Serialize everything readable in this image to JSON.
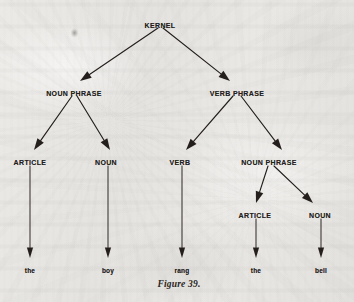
{
  "figure": {
    "caption": "Figure 39.",
    "caption_x": 179,
    "caption_y": 279
  },
  "colors": {
    "paper": "#e8e8e6",
    "ink": "#241f1d",
    "caption_ink": "#2a2522"
  },
  "artifacts": [
    {
      "name": "scan-smudge",
      "x": 69,
      "y": 27,
      "w": 11,
      "h": 13
    }
  ],
  "chart_data": {
    "type": "diagram",
    "subtype": "syntactic-parse-tree",
    "title": "Figure 39.",
    "sentence": "the boy rang the bell",
    "nodes": [
      {
        "id": "kernel",
        "label": "KERNEL",
        "level": 0,
        "kind": "nonterminal",
        "x": 160,
        "y": 22
      },
      {
        "id": "np1",
        "label": "NOUN PHRASE",
        "level": 1,
        "kind": "nonterminal",
        "x": 74,
        "y": 90
      },
      {
        "id": "vp",
        "label": "VERB PHRASE",
        "level": 1,
        "kind": "nonterminal",
        "x": 237,
        "y": 90
      },
      {
        "id": "art1",
        "label": "ARTICLE",
        "level": 2,
        "kind": "nonterminal",
        "x": 30,
        "y": 159
      },
      {
        "id": "noun1",
        "label": "NOUN",
        "level": 2,
        "kind": "nonterminal",
        "x": 106,
        "y": 159
      },
      {
        "id": "verb",
        "label": "VERB",
        "level": 2,
        "kind": "nonterminal",
        "x": 180,
        "y": 159
      },
      {
        "id": "np2",
        "label": "NOUN PHRASE",
        "level": 2,
        "kind": "nonterminal",
        "x": 269,
        "y": 159
      },
      {
        "id": "art2",
        "label": "ARTICLE",
        "level": 3,
        "kind": "nonterminal",
        "x": 255,
        "y": 212
      },
      {
        "id": "noun2",
        "label": "NOUN",
        "level": 3,
        "kind": "nonterminal",
        "x": 320,
        "y": 212
      },
      {
        "id": "word_the1",
        "label": "the",
        "level": 4,
        "kind": "terminal",
        "x": 30,
        "y": 267
      },
      {
        "id": "word_boy",
        "label": "boy",
        "level": 4,
        "kind": "terminal",
        "x": 108,
        "y": 267
      },
      {
        "id": "word_rang",
        "label": "rang",
        "level": 4,
        "kind": "terminal",
        "x": 182,
        "y": 267
      },
      {
        "id": "word_the2",
        "label": "the",
        "level": 4,
        "kind": "terminal",
        "x": 256,
        "y": 267
      },
      {
        "id": "word_bell",
        "label": "bell",
        "level": 4,
        "kind": "terminal",
        "x": 321,
        "y": 267
      }
    ],
    "edges": [
      {
        "from": "kernel",
        "to": "np1",
        "x1": 158,
        "y1": 28,
        "x2": 80,
        "y2": 81,
        "style": "arrow"
      },
      {
        "from": "kernel",
        "to": "vp",
        "x1": 163,
        "y1": 28,
        "x2": 230,
        "y2": 81,
        "style": "arrow"
      },
      {
        "from": "np1",
        "to": "art1",
        "x1": 72,
        "y1": 96,
        "x2": 34,
        "y2": 150,
        "style": "arrow"
      },
      {
        "from": "np1",
        "to": "noun1",
        "x1": 77,
        "y1": 96,
        "x2": 110,
        "y2": 150,
        "style": "arrow"
      },
      {
        "from": "vp",
        "to": "verb",
        "x1": 233,
        "y1": 96,
        "x2": 186,
        "y2": 150,
        "style": "arrow"
      },
      {
        "from": "vp",
        "to": "np2",
        "x1": 241,
        "y1": 96,
        "x2": 282,
        "y2": 150,
        "style": "arrow"
      },
      {
        "from": "np2",
        "to": "art2",
        "x1": 268,
        "y1": 166,
        "x2": 256,
        "y2": 203,
        "style": "arrow"
      },
      {
        "from": "np2",
        "to": "noun2",
        "x1": 274,
        "y1": 166,
        "x2": 313,
        "y2": 203,
        "style": "arrow"
      },
      {
        "from": "art1",
        "to": "word_the1",
        "x1": 30,
        "y1": 166,
        "x2": 30,
        "y2": 258,
        "style": "arrow"
      },
      {
        "from": "noun1",
        "to": "word_boy",
        "x1": 108,
        "y1": 166,
        "x2": 108,
        "y2": 258,
        "style": "arrow"
      },
      {
        "from": "verb",
        "to": "word_rang",
        "x1": 182,
        "y1": 166,
        "x2": 182,
        "y2": 258,
        "style": "arrow"
      },
      {
        "from": "art2",
        "to": "word_the2",
        "x1": 256,
        "y1": 219,
        "x2": 256,
        "y2": 258,
        "style": "arrow"
      },
      {
        "from": "noun2",
        "to": "word_bell",
        "x1": 321,
        "y1": 219,
        "x2": 321,
        "y2": 258,
        "style": "arrow"
      }
    ]
  }
}
